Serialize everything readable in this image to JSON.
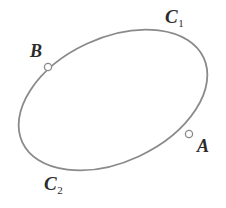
{
  "figure": {
    "name": "closed-curve-with-two-points",
    "background_color": "#ffffff",
    "width": 226,
    "height": 208,
    "curve": {
      "kind": "ellipse",
      "stroke_color": "#8a8a8a",
      "stroke_width": 1.8,
      "fill": "none",
      "center_x": 113,
      "center_y": 100,
      "radius_x": 100,
      "radius_y": 62,
      "rotation_deg": -25
    },
    "markers": [
      {
        "id": "B",
        "name": "point-marker-b",
        "x": 48,
        "y": 67,
        "radius": 3.6,
        "fill": "#ffffff",
        "stroke_color": "#8a8a8a",
        "stroke_width": 1.3
      },
      {
        "id": "A",
        "name": "point-marker-a",
        "x": 189,
        "y": 134,
        "radius": 3.6,
        "fill": "#ffffff",
        "stroke_color": "#8a8a8a",
        "stroke_width": 1.3
      }
    ],
    "labels": {
      "arc_upper": {
        "base": "C",
        "subscript": "1"
      },
      "arc_lower": {
        "base": "C",
        "subscript": "2"
      },
      "point_b": {
        "base": "B",
        "subscript": ""
      },
      "point_a": {
        "base": "A",
        "subscript": ""
      }
    },
    "label_color": "#2b2b2b"
  }
}
